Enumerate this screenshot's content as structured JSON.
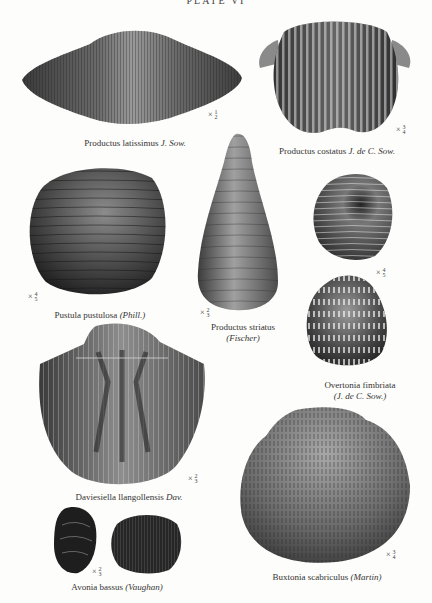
{
  "plate": {
    "title": "PLATE VI"
  },
  "specimens": [
    {
      "id": "productus-latissimus",
      "name": "Productus latissimus",
      "author": "J. Sow.",
      "author_italic": true,
      "scale": "× ½",
      "scale_num": "1",
      "scale_den": "2"
    },
    {
      "id": "productus-costatus",
      "name": "Productus costatus",
      "author": "J. de C. Sow.",
      "author_italic": true,
      "scale": "× ¾",
      "scale_num": "3",
      "scale_den": "4"
    },
    {
      "id": "pustula-pustulosa",
      "name": "Pustula pustulosa",
      "author": "(Phill.)",
      "author_italic": true,
      "scale": "× ⅘",
      "scale_num": "4",
      "scale_den": "5"
    },
    {
      "id": "productus-striatus",
      "name": "Productus striatus",
      "author": "(Fischer)",
      "author_italic": true,
      "scale": "× ⅔",
      "scale_num": "2",
      "scale_den": "3"
    },
    {
      "id": "overtonia-fimbriata",
      "name": "Overtonia fimbriata",
      "author": "(J. de C. Sow.)",
      "author_italic": true,
      "scale": "× ⅘",
      "scale_num": "4",
      "scale_den": "5"
    },
    {
      "id": "daviesiella-llangollensis",
      "name": "Daviesiella llangollensis",
      "author": "Dav.",
      "author_italic": true,
      "scale": "× ⅔",
      "scale_num": "2",
      "scale_den": "3"
    },
    {
      "id": "avonia-bassus",
      "name": "Avonia bassus",
      "author": "(Vaughan)",
      "author_italic": true,
      "scale": "× ⅔",
      "scale_num": "2",
      "scale_den": "3"
    },
    {
      "id": "buxtonia-scabriculus",
      "name": "Buxtonia scabriculus",
      "author": "(Martin)",
      "author_italic": true,
      "scale": "× ¾",
      "scale_num": "3",
      "scale_den": "4"
    }
  ],
  "scale_prefix": "×"
}
